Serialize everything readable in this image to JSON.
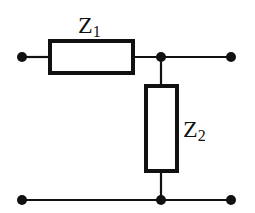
{
  "diagram": {
    "type": "circuit",
    "colors": {
      "stroke": "#111111",
      "background": "#ffffff"
    },
    "components": [
      {
        "id": "Z1",
        "kind": "impedance",
        "orientation": "horizontal",
        "label_main": "Z",
        "label_sub": "1"
      },
      {
        "id": "Z2",
        "kind": "impedance",
        "orientation": "vertical",
        "label_main": "Z",
        "label_sub": "2"
      }
    ],
    "terminals": [
      "input-top",
      "input-bottom",
      "output-top",
      "output-bottom"
    ],
    "junctions": [
      "top-junction",
      "bottom-junction"
    ]
  }
}
